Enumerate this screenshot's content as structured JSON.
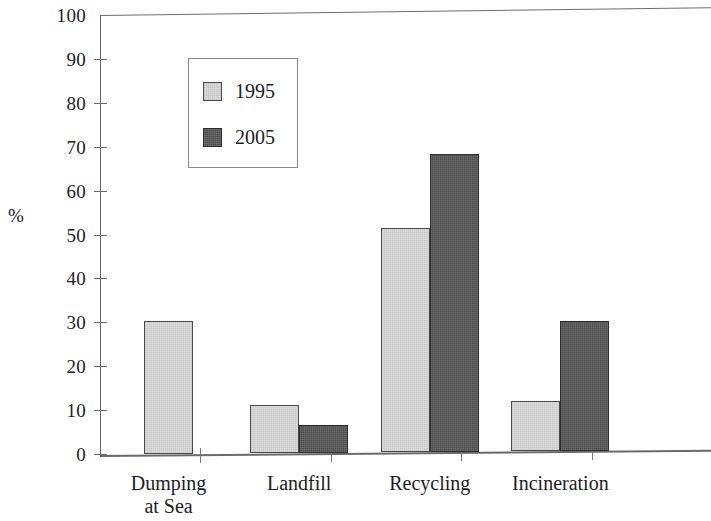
{
  "chart_data": {
    "type": "bar",
    "title": "",
    "subtitle": "",
    "xlabel": "",
    "ylabel": "%",
    "ylim": [
      0,
      100
    ],
    "ytick_step": 10,
    "yticks": [
      0,
      10,
      20,
      30,
      40,
      50,
      60,
      70,
      80,
      90,
      100
    ],
    "ytick_labels": [
      "0",
      "10",
      "20",
      "30",
      "40",
      "50",
      "60",
      "70",
      "80",
      "90",
      "100"
    ],
    "grid": false,
    "legend_position": "upper-left-inside",
    "categories": [
      "Dumping\nat Sea",
      "Landfill",
      "Recycling",
      "Incineration"
    ],
    "category_labels_flat": [
      "Dumping at Sea",
      "Landfill",
      "Recycling",
      "Incineration"
    ],
    "series": [
      {
        "name": "1995",
        "color": "#dcdcdc",
        "edge_color": "#4a4a4a",
        "values": [
          30.5,
          11,
          51,
          11.5
        ]
      },
      {
        "name": "2005",
        "color": "#4c4c4c",
        "edge_color": "#2e2e2e",
        "values": [
          0,
          6.5,
          68,
          29.5
        ]
      }
    ]
  },
  "legend": {
    "entries": [
      {
        "label": "1995",
        "swatch": "light-gray-swatch"
      },
      {
        "label": "2005",
        "swatch": "dark-gray-swatch"
      }
    ]
  },
  "axis": {
    "y_unit_label": "%"
  }
}
